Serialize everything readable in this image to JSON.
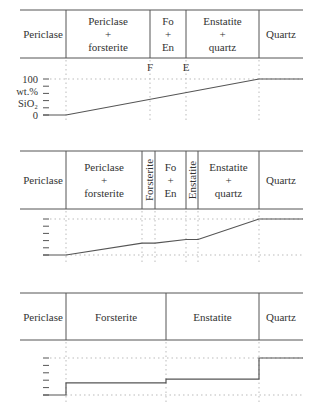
{
  "panels": [
    {
      "id": "panel-1",
      "header": {
        "top": 10,
        "bottom": 58,
        "left": 20,
        "right": 303,
        "cells": [
          {
            "x0": 20,
            "x1": 66,
            "lines": [
              "Periclase"
            ],
            "vertical": false
          },
          {
            "x0": 66,
            "x1": 150,
            "lines": [
              "Periclase",
              "+",
              "forsterite"
            ],
            "vertical": false
          },
          {
            "x0": 150,
            "x1": 186,
            "lines": [
              "Fo",
              "+",
              "En"
            ],
            "vertical": false
          },
          {
            "x0": 186,
            "x1": 259,
            "lines": [
              "Enstatite",
              "+",
              "quartz"
            ],
            "vertical": false
          },
          {
            "x0": 259,
            "x1": 303,
            "lines": [
              "Quartz"
            ],
            "vertical": false
          }
        ]
      },
      "markers": [
        {
          "label": "F",
          "x": 150
        },
        {
          "label": "E",
          "x": 186
        }
      ],
      "graph": {
        "y_top": 79,
        "y_bottom": 115,
        "x_start": 43,
        "x_end": 303,
        "ylabel": [
          "wt.%",
          "SiO₂"
        ],
        "tick_labels": [
          {
            "text": "100",
            "value": 100
          },
          {
            "text": "0",
            "value": 0
          }
        ],
        "ticks": 6,
        "profile": [
          [
            43,
            0
          ],
          [
            66,
            0
          ],
          [
            259,
            100
          ],
          [
            303,
            100
          ]
        ]
      }
    },
    {
      "id": "panel-2",
      "header": {
        "top": 151,
        "bottom": 209,
        "left": 20,
        "right": 303,
        "cells": [
          {
            "x0": 20,
            "x1": 66,
            "lines": [
              "Periclase"
            ],
            "vertical": false
          },
          {
            "x0": 66,
            "x1": 142,
            "lines": [
              "Periclase",
              "+",
              "forsterite"
            ],
            "vertical": false
          },
          {
            "x0": 142,
            "x1": 155,
            "lines": [
              "Forsterite"
            ],
            "vertical": true
          },
          {
            "x0": 155,
            "x1": 186,
            "lines": [
              "Fo",
              "+",
              "En"
            ],
            "vertical": false
          },
          {
            "x0": 186,
            "x1": 198,
            "lines": [
              "Enstatite"
            ],
            "vertical": true
          },
          {
            "x0": 198,
            "x1": 259,
            "lines": [
              "Enstatite",
              "+",
              "quartz"
            ],
            "vertical": false
          },
          {
            "x0": 259,
            "x1": 303,
            "lines": [
              "Quartz"
            ],
            "vertical": false
          }
        ]
      },
      "markers": [],
      "graph": {
        "y_top": 219,
        "y_bottom": 255,
        "x_start": 43,
        "x_end": 303,
        "ylabel": [],
        "tick_labels": [],
        "ticks": 6,
        "profile": [
          [
            43,
            0
          ],
          [
            66,
            0
          ],
          [
            142,
            33
          ],
          [
            155,
            33
          ],
          [
            186,
            43
          ],
          [
            198,
            43
          ],
          [
            259,
            100
          ],
          [
            303,
            100
          ]
        ]
      }
    },
    {
      "id": "panel-3",
      "header": {
        "top": 293,
        "bottom": 340,
        "left": 20,
        "right": 303,
        "cells": [
          {
            "x0": 20,
            "x1": 66,
            "lines": [
              "Periclase"
            ],
            "vertical": false
          },
          {
            "x0": 66,
            "x1": 166,
            "lines": [
              "Forsterite"
            ],
            "vertical": false
          },
          {
            "x0": 166,
            "x1": 259,
            "lines": [
              "Enstatite"
            ],
            "vertical": false
          },
          {
            "x0": 259,
            "x1": 303,
            "lines": [
              "Quartz"
            ],
            "vertical": false
          }
        ]
      },
      "markers": [],
      "graph": {
        "y_top": 358,
        "y_bottom": 395,
        "x_start": 43,
        "x_end": 303,
        "ylabel": [],
        "tick_labels": [],
        "ticks": 6,
        "profile": [
          [
            43,
            0
          ],
          [
            66,
            0
          ],
          [
            66,
            33
          ],
          [
            166,
            33
          ],
          [
            166,
            43
          ],
          [
            259,
            43
          ],
          [
            259,
            100
          ],
          [
            303,
            100
          ]
        ]
      }
    }
  ],
  "colors": {
    "line": "#555555",
    "grid": "#bbbbbb",
    "text": "#333333"
  }
}
